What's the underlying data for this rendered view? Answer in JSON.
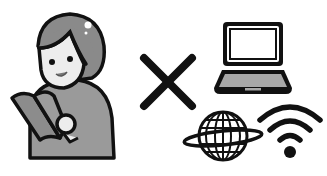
{
  "illustration": {
    "caption": "Person reading a book × laptop, internet globe and Wi-Fi",
    "left": {
      "label": "person reading book",
      "icon": "person-reading-icon"
    },
    "operator": {
      "label": "×",
      "icon": "multiply-icon"
    },
    "right": [
      {
        "label": "laptop",
        "icon": "laptop-icon"
      },
      {
        "label": "globe",
        "icon": "globe-icon"
      },
      {
        "label": "wifi",
        "icon": "wifi-icon"
      }
    ]
  },
  "colors": {
    "outline": "#111111",
    "hair": "#8a8a8a",
    "skin": "#ededed",
    "body": "#9a9a9a",
    "book": "#8c8c8c",
    "laptop_base": "#a8a8a8",
    "background": "#ffffff"
  }
}
